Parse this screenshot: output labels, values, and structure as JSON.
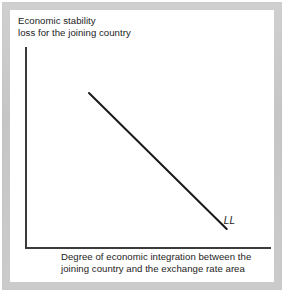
{
  "figure": {
    "background_color": "#ffffff",
    "frame_color": "#c9c9c9",
    "plate_color": "#ffffff",
    "axis_color": "#3b3b3b",
    "text_color": "#1c1c1c"
  },
  "axes": {
    "ylabel_line1": "Economic stability",
    "ylabel_line2": "loss for the joining country",
    "xlabel_line1": "Degree of economic integration between the",
    "xlabel_line2": "joining country and the exchange rate area"
  },
  "curve": {
    "label": "LL",
    "color": "#1a1a1a"
  },
  "chart_data": {
    "type": "line",
    "title": "",
    "subtitle": "",
    "xlabel": "Degree of economic integration between the joining country and the exchange rate area",
    "ylabel": "Economic stability loss for the joining country",
    "grid": false,
    "legend_position": "inline-right-end",
    "xlim": [
      0,
      1
    ],
    "ylim": [
      0,
      1
    ],
    "xticks": [],
    "yticks": [],
    "xticklabels": [],
    "yticklabels": [],
    "annotations": [
      {
        "text": "LL",
        "x": 0.82,
        "y": 0.1,
        "style": "italic",
        "description": "label for the downward-sloping stability-loss schedule"
      }
    ],
    "series": [
      {
        "name": "LL",
        "style": "solid",
        "color": "#1a1a1a",
        "x": [
          0.26,
          0.82
        ],
        "y": [
          0.77,
          0.09
        ],
        "description": "straight downward-sloping line: stability loss falls as economic integration rises"
      }
    ]
  }
}
